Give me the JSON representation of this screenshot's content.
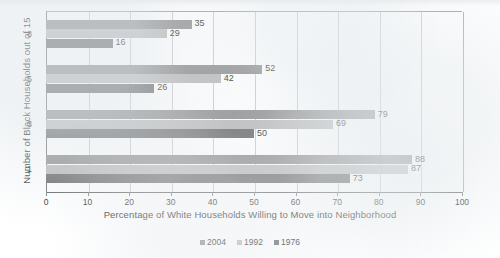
{
  "chart_data": {
    "type": "bar",
    "orientation": "horizontal",
    "title": "",
    "xlabel": "Percentage of White Households  Willing to Move into Neighborhood",
    "ylabel": "Number of Black Households out of 15",
    "categories": [
      "8",
      "5",
      "3",
      "1"
    ],
    "xlim": [
      0,
      100
    ],
    "xticks": [
      0,
      10,
      20,
      30,
      40,
      50,
      60,
      70,
      80,
      90,
      100
    ],
    "grid": "vertical",
    "legend_position": "bottom",
    "series": [
      {
        "name": "2004",
        "color": "#8b8b8b",
        "values": [
          35,
          52,
          79,
          88
        ]
      },
      {
        "name": "1992",
        "color": "#b7b7b7",
        "values": [
          29,
          42,
          69,
          87
        ]
      },
      {
        "name": "1976",
        "color": "#676767",
        "values": [
          16,
          26,
          50,
          73
        ]
      }
    ],
    "data_labels": [
      {
        "category": "8",
        "2004": 35,
        "1992": 29,
        "1976": 16
      },
      {
        "category": "5",
        "2004": 52,
        "1992": 42,
        "1976": 26
      },
      {
        "category": "3",
        "2004": 79,
        "1992": 69,
        "1976": 50
      },
      {
        "category": "1",
        "2004": 88,
        "1992": 87,
        "1976": 73
      }
    ]
  }
}
